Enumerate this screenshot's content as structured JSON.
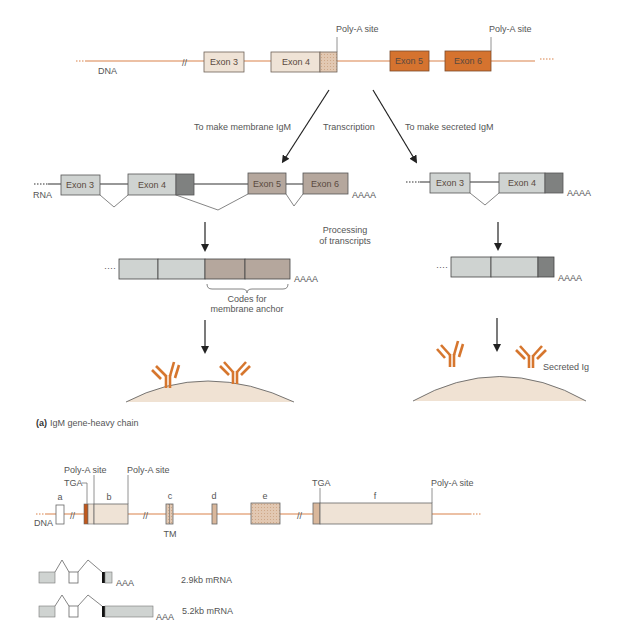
{
  "figure": {
    "caption_prefix": "(a)",
    "caption": "IgM gene-heavy chain"
  },
  "top_dna": {
    "label": "DNA",
    "exons": [
      {
        "label": "Exon 3"
      },
      {
        "label": "Exon 4"
      },
      {
        "label": "Exon 5"
      },
      {
        "label": "Exon 6"
      }
    ],
    "polya_labels": [
      "Poly-A site",
      "Poly-A site"
    ]
  },
  "branches": {
    "left_label": "To make membrane IgM",
    "center_label": "Transcription",
    "right_label": "To make secreted IgM"
  },
  "rna_membrane": {
    "label": "RNA",
    "exons": [
      {
        "label": "Exon 3"
      },
      {
        "label": "Exon 4"
      },
      {
        "label": "Exon 5"
      },
      {
        "label": "Exon 6"
      }
    ],
    "tail": "AAAA"
  },
  "rna_secreted": {
    "exons": [
      {
        "label": "Exon 3"
      },
      {
        "label": "Exon 4"
      }
    ],
    "tail": "AAAA"
  },
  "processing": {
    "line1": "Processing",
    "line2": "of transcripts"
  },
  "mrna_membrane": {
    "tail": "AAAA",
    "brace_line1": "Codes for",
    "brace_line2": "membrane anchor"
  },
  "mrna_secreted": {
    "tail": "AAAA"
  },
  "cells": {
    "secreted_label": "Secreted Ig"
  },
  "bottom_gene": {
    "dna_label": "DNA",
    "tga_labels": [
      "TGA",
      "TGA"
    ],
    "polya_labels": [
      "Poly-A site",
      "Poly-A site",
      "Poly-A site"
    ],
    "exons": [
      {
        "label": "a"
      },
      {
        "label": "b"
      },
      {
        "label": "c"
      },
      {
        "label": "d"
      },
      {
        "label": "e"
      },
      {
        "label": "f"
      }
    ],
    "tm_label": "TM"
  },
  "transcripts": [
    {
      "tail": "AAA",
      "label": "2.9kb mRNA"
    },
    {
      "tail": "AAA",
      "label": "5.2kb mRNA"
    }
  ],
  "colors": {
    "dna_line": "#d9824a",
    "exon_light": "#efe3d6",
    "exon_orange": "#d5732f",
    "exon_tan": "#d9b79b",
    "rna_gray": "#cfd3d1",
    "rna_dark": "#7f8180",
    "rna_brown": "#b5a79d",
    "antibody": "#d6762e",
    "cell": "#f0e2d3"
  }
}
